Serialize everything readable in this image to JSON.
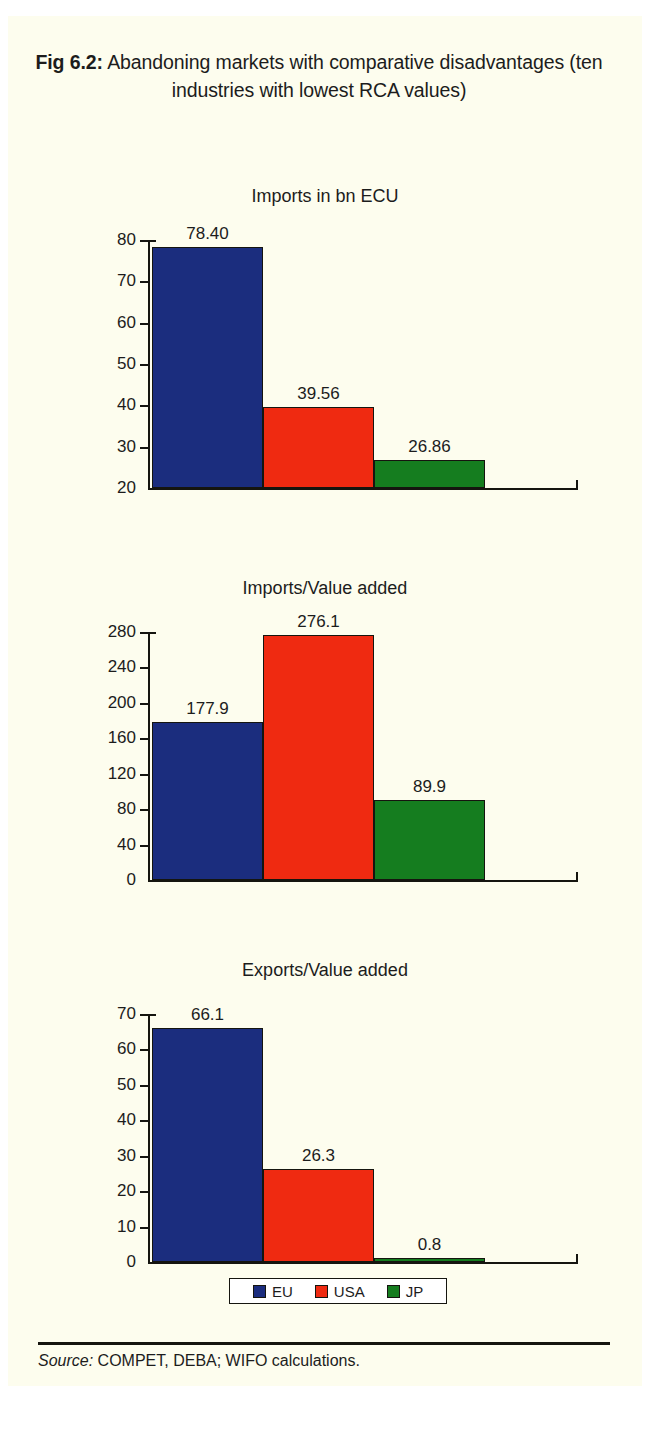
{
  "figure": {
    "label": "Fig 6.2:",
    "title_text": " Abandoning markets with comparative disadvantages (ten industries with lowest RCA values)"
  },
  "legend": {
    "items": [
      {
        "label": "EU",
        "color": "#1b2d7e"
      },
      {
        "label": "USA",
        "color": "#ef2a11"
      },
      {
        "label": "JP",
        "color": "#157d1f"
      }
    ]
  },
  "footer": {
    "source_label": "Source:",
    "source_text": " COMPET, DEBA; WIFO calculations."
  },
  "colors": {
    "background": "#fdfdee",
    "page": "#ffffff",
    "ink": "#15150f",
    "eu": "#1b2d7e",
    "usa": "#ef2a11",
    "jp": "#157d1f"
  },
  "chart_data": [
    {
      "type": "bar",
      "title": "Imports in bn ECU",
      "xlabel": "",
      "ylabel": "",
      "categories": [
        "EU",
        "USA",
        "JP"
      ],
      "values": [
        78.4,
        39.56,
        26.86
      ],
      "value_labels": [
        "78.40",
        "39.56",
        "26.86"
      ],
      "ylim": [
        20,
        80
      ],
      "yticks": [
        20,
        30,
        40,
        50,
        60,
        70,
        80
      ],
      "ytick_labels": [
        "20",
        "30",
        "40",
        "50",
        "60",
        "70",
        "80"
      ],
      "grid": false,
      "legend_position": "bottom"
    },
    {
      "type": "bar",
      "title": "Imports/Value added",
      "xlabel": "",
      "ylabel": "",
      "categories": [
        "EU",
        "USA",
        "JP"
      ],
      "values": [
        177.9,
        276.1,
        89.9
      ],
      "value_labels": [
        "177.9",
        "276.1",
        "89.9"
      ],
      "ylim": [
        0,
        280
      ],
      "yticks": [
        0,
        40,
        80,
        120,
        160,
        200,
        240,
        280
      ],
      "ytick_labels": [
        "0",
        "40",
        "80",
        "120",
        "160",
        "200",
        "240",
        "280"
      ],
      "grid": false,
      "legend_position": "bottom"
    },
    {
      "type": "bar",
      "title": "Exports/Value added",
      "xlabel": "",
      "ylabel": "",
      "categories": [
        "EU",
        "USA",
        "JP"
      ],
      "values": [
        66.1,
        26.3,
        0.8
      ],
      "value_labels": [
        "66.1",
        "26.3",
        "0.8"
      ],
      "ylim": [
        0,
        70
      ],
      "yticks": [
        0,
        10,
        20,
        30,
        40,
        50,
        60,
        70
      ],
      "ytick_labels": [
        "0",
        "10",
        "20",
        "30",
        "40",
        "50",
        "60",
        "70"
      ],
      "grid": false,
      "legend_position": "bottom"
    }
  ]
}
